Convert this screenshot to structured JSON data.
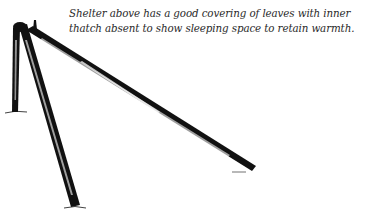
{
  "caption": {
    "text": "Shelter above has a good covering of leaves with inner thatch absent to show sleeping space to retain warmth."
  },
  "illustration": {
    "subject": "three-pole-shelter-frame",
    "poles": [
      {
        "name": "left-upright-pole",
        "from": [
          18,
          24
        ],
        "to": [
          15,
          112
        ]
      },
      {
        "name": "front-leaning-pole",
        "from": [
          22,
          24
        ],
        "to": [
          75,
          207
        ]
      },
      {
        "name": "long-ridge-pole",
        "from": [
          28,
          30
        ],
        "to": [
          254,
          170
        ]
      }
    ],
    "colors": {
      "ink": "#111111",
      "paper": "#ffffff",
      "text": "#2a2a2a"
    }
  }
}
